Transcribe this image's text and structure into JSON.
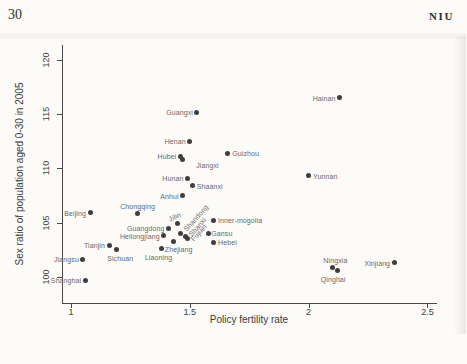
{
  "page": {
    "page_number": "30",
    "running_head": "NIU"
  },
  "chart_data": {
    "type": "scatter",
    "title": "",
    "xlabel": "Policy fertility rate",
    "ylabel": "Sex ratio of population aged 0-30 in 2005",
    "xticks": [
      "1",
      "1.5",
      "2",
      "2.5"
    ],
    "xtick_values": [
      1,
      1.5,
      2,
      2.5
    ],
    "yticks": [
      "100",
      "105",
      "110",
      "115",
      "120"
    ],
    "ytick_values": [
      100,
      105,
      110,
      115,
      120
    ],
    "xlim": [
      0.96,
      2.54
    ],
    "ylim": [
      97.6,
      121.4
    ],
    "grid": false,
    "legend": "none",
    "marker_color": "#3e3e40",
    "label_color": "#67676a",
    "axis_color": "#49494b",
    "points": [
      {
        "name": "Shanghai",
        "x": 1.06,
        "y": 99.7,
        "pos": "left"
      },
      {
        "name": "Jiangsu",
        "x": 1.05,
        "y": 101.6,
        "pos": "left"
      },
      {
        "name": "Beijing",
        "x": 1.08,
        "y": 105.9,
        "pos": "left"
      },
      {
        "name": "Tianjin",
        "x": 1.16,
        "y": 102.9,
        "pos": "left"
      },
      {
        "name": "Sichuan",
        "x": 1.19,
        "y": 102.5,
        "pos": "below",
        "dx": 4,
        "dy": 2
      },
      {
        "name": "Chongqing",
        "x": 1.28,
        "y": 105.8,
        "pos": "above"
      },
      {
        "name": "Zhejiang",
        "x": 1.38,
        "y": 102.6,
        "pos": "right",
        "dx": -1
      },
      {
        "name": "Liaoning",
        "x": 1.43,
        "y": 103.3,
        "pos": "below-left",
        "dx": 2,
        "dy": 9
      },
      {
        "name": "Heilongjiang",
        "x": 1.39,
        "y": 103.8,
        "pos": "left"
      },
      {
        "name": "Guangdong",
        "x": 1.41,
        "y": 104.5,
        "pos": "left"
      },
      {
        "name": "Jilin",
        "x": 1.45,
        "y": 104.9,
        "pos": "above",
        "angle": -24,
        "dx": -2
      },
      {
        "name": "Shandong",
        "x": 1.46,
        "y": 104.0,
        "pos": "right",
        "angle": -48,
        "dy": -3
      },
      {
        "name": "Shanxi",
        "x": 1.48,
        "y": 103.7,
        "pos": "right",
        "angle": -48,
        "dy": -2
      },
      {
        "name": "Fujian",
        "x": 1.49,
        "y": 103.5,
        "pos": "right",
        "angle": -48,
        "dy": 1
      },
      {
        "name": "Gansu",
        "x": 1.58,
        "y": 104.0,
        "pos": "right",
        "dx": -2
      },
      {
        "name": "Hebei",
        "x": 1.6,
        "y": 103.2,
        "pos": "right"
      },
      {
        "name": "Inner-mogolia",
        "x": 1.6,
        "y": 105.2,
        "pos": "right"
      },
      {
        "name": "Anhui",
        "x": 1.47,
        "y": 107.5,
        "pos": "left"
      },
      {
        "name": "Hunan",
        "x": 1.49,
        "y": 109.1,
        "pos": "left"
      },
      {
        "name": "Shaanxi",
        "x": 1.51,
        "y": 108.4,
        "pos": "right"
      },
      {
        "name": "Hubei",
        "x": 1.46,
        "y": 111.1,
        "pos": "left"
      },
      {
        "name": "Jiangxi",
        "x": 1.47,
        "y": 110.8,
        "pos": "right",
        "dx": 9,
        "dy": 5
      },
      {
        "name": "Henan",
        "x": 1.5,
        "y": 112.5,
        "pos": "left"
      },
      {
        "name": "Guangxi",
        "x": 1.53,
        "y": 115.2,
        "pos": "left"
      },
      {
        "name": "Guizhou",
        "x": 1.66,
        "y": 111.4,
        "pos": "right"
      },
      {
        "name": "Yunnan",
        "x": 2.0,
        "y": 109.3,
        "pos": "right"
      },
      {
        "name": "Hainan",
        "x": 2.13,
        "y": 116.5,
        "pos": "left"
      },
      {
        "name": "Ningxia",
        "x": 2.1,
        "y": 100.9,
        "pos": "above",
        "dx": 3
      },
      {
        "name": "Qinghai",
        "x": 2.12,
        "y": 100.6,
        "pos": "below",
        "dx": -4,
        "dy": 2
      },
      {
        "name": "Xinjiang",
        "x": 2.36,
        "y": 101.3,
        "pos": "left"
      }
    ]
  }
}
